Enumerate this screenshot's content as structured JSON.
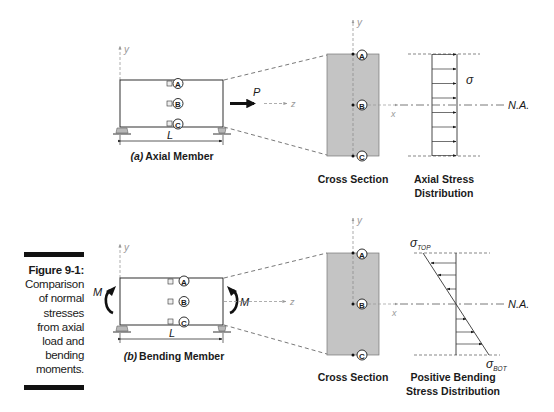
{
  "figure": {
    "number": "Figure 9-1:",
    "caption_lines": [
      "Comparison",
      "of normal",
      "stresses",
      "from axial",
      "load and",
      "bending",
      "moments."
    ]
  },
  "panel_a": {
    "title_prefix": "(a)",
    "title": "Axial Member",
    "load_label": "P",
    "length_label": "L",
    "axis_y": "y",
    "axis_z": "z",
    "points": [
      "A",
      "B",
      "C"
    ],
    "cross_section": {
      "title": "Cross Section",
      "axis_y": "y",
      "axis_x": "x",
      "points": [
        "A",
        "B",
        "C"
      ]
    },
    "stress": {
      "title_line1": "Axial Stress",
      "title_line2": "Distribution",
      "sigma": "σ",
      "neutral_axis": "N.A.",
      "arrow_count": 8
    }
  },
  "panel_b": {
    "title_prefix": "(b)",
    "title": "Bending Member",
    "moment_label_left": "M",
    "moment_label_right": "M",
    "length_label": "L",
    "axis_y": "y",
    "axis_z": "z",
    "points": [
      "A",
      "B",
      "C"
    ],
    "cross_section": {
      "title": "Cross Section",
      "axis_y": "y",
      "axis_x": "x",
      "points": [
        "A",
        "B",
        "C"
      ]
    },
    "stress": {
      "title_line1": "Positive Bending",
      "title_line2": "Stress Distribution",
      "sigma": "σ",
      "sigma_top_sub": "TOP",
      "sigma_bot_sub": "BOT",
      "neutral_axis": "N.A."
    }
  },
  "colors": {
    "line": "#1a1a1a",
    "dashed": "#555555",
    "axis": "#999999",
    "section_fill": "#c4c4c4",
    "support_fill": "#b8b8b8"
  }
}
